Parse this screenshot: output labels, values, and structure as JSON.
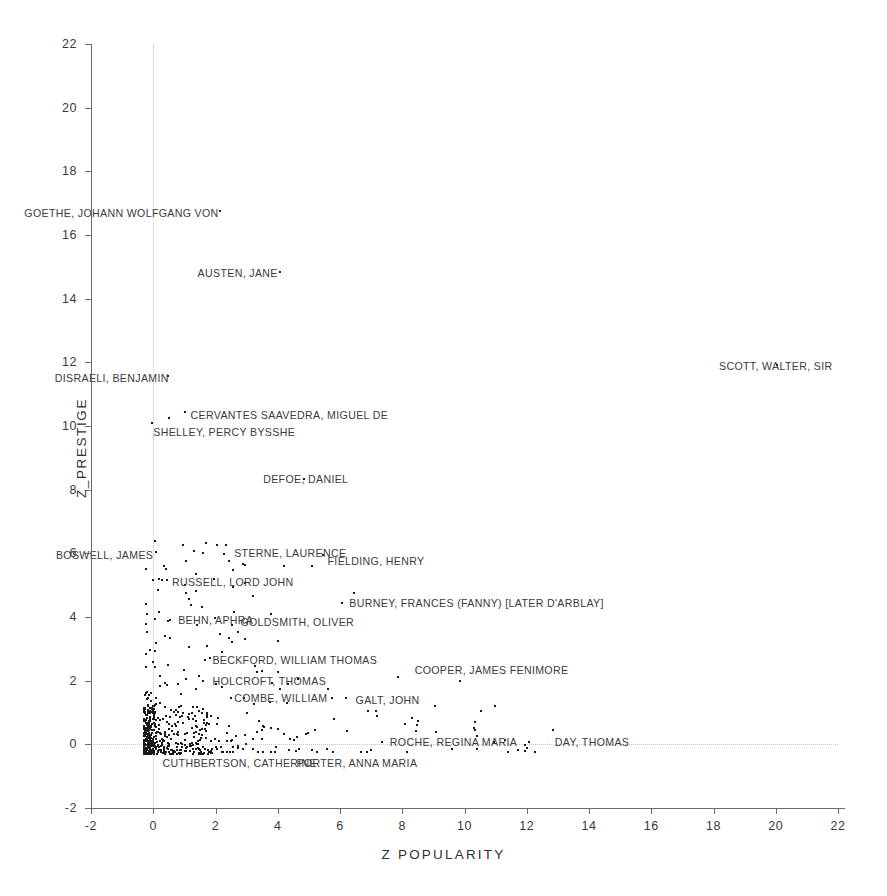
{
  "chart_data": {
    "type": "scatter",
    "title": "",
    "xlabel": "Z  POPULARITY",
    "ylabel": "Z_PRESTIGE",
    "xlim": [
      -2,
      22
    ],
    "ylim": [
      -2,
      22
    ],
    "xticks": [
      -2,
      0,
      2,
      4,
      6,
      8,
      10,
      12,
      14,
      16,
      18,
      20,
      22
    ],
    "yticks": [
      -2,
      0,
      2,
      4,
      6,
      8,
      10,
      12,
      14,
      16,
      18,
      20,
      22
    ],
    "grid": "dotted reference lines at x=0 and y=0 only",
    "legend": "none",
    "marker_color": "#1a1a1a",
    "axis_color": "#6a6a6a",
    "gridline_color": "#c8c6c2",
    "background": "#ffffff",
    "annotations": [
      {
        "label": "GOETHE, JOHANN WOLFGANG VON",
        "x": 2.1,
        "y": 16.7,
        "anchor": "right"
      },
      {
        "label": "AUSTEN, JANE",
        "x": 4.0,
        "y": 14.8,
        "anchor": "right"
      },
      {
        "label": "SCOTT, WALTER, SIR",
        "x": 20.0,
        "y": 11.9,
        "anchor": "center"
      },
      {
        "label": "DISRAELI, BENJAMIN",
        "x": 0.5,
        "y": 11.5,
        "anchor": "right"
      },
      {
        "label": "CERVANTES SAAVEDRA, MIGUEL DE",
        "x": 1.2,
        "y": 10.35,
        "anchor": "left"
      },
      {
        "label": "SHELLEY, PERCY BYSSHE",
        "x": 0.0,
        "y": 9.8,
        "anchor": "left"
      },
      {
        "label": "DEFOE, DANIEL",
        "x": 4.9,
        "y": 8.35,
        "anchor": "center"
      },
      {
        "label": "STERNE, LAURENCE",
        "x": 2.6,
        "y": 6.0,
        "anchor": "left"
      },
      {
        "label": "BOSWELL, JAMES",
        "x": 0.0,
        "y": 5.95,
        "anchor": "right"
      },
      {
        "label": "FIELDING, HENRY",
        "x": 5.6,
        "y": 5.75,
        "anchor": "left"
      },
      {
        "label": "RUSSELL, LORD JOHN",
        "x": 0.6,
        "y": 5.1,
        "anchor": "left"
      },
      {
        "label": "BURNEY, FRANCES (FANNY) [LATER D'ARBLAY]",
        "x": 6.3,
        "y": 4.45,
        "anchor": "left"
      },
      {
        "label": "BEHN, APHRA",
        "x": 0.8,
        "y": 3.9,
        "anchor": "left"
      },
      {
        "label": "GOLDSMITH, OLIVER",
        "x": 2.8,
        "y": 3.85,
        "anchor": "left"
      },
      {
        "label": "BECKFORD, WILLIAM THOMAS",
        "x": 1.9,
        "y": 2.65,
        "anchor": "left"
      },
      {
        "label": "COOPER, JAMES FENIMORE",
        "x": 8.4,
        "y": 2.35,
        "anchor": "left"
      },
      {
        "label": "HOLCROFT, THOMAS",
        "x": 1.9,
        "y": 2.0,
        "anchor": "left"
      },
      {
        "label": "COMBE, WILLIAM",
        "x": 2.6,
        "y": 1.45,
        "anchor": "left"
      },
      {
        "label": "GALT, JOHN",
        "x": 6.5,
        "y": 1.4,
        "anchor": "left"
      },
      {
        "label": "ROCHE, REGINA MARIA",
        "x": 7.6,
        "y": 0.08,
        "anchor": "left"
      },
      {
        "label": "DAY, THOMAS",
        "x": 12.9,
        "y": 0.08,
        "anchor": "left"
      },
      {
        "label": "CUTHBERTSON, CATHERINE",
        "x": 0.3,
        "y": -0.6,
        "anchor": "left"
      },
      {
        "label": "PORTER, ANNA MARIA",
        "x": 4.6,
        "y": -0.6,
        "anchor": "left"
      }
    ],
    "labeled_points": [
      {
        "name": "GOETHE, JOHANN WOLFGANG VON",
        "x": 2.14,
        "y": 16.75
      },
      {
        "name": "AUSTEN, JANE",
        "x": 4.07,
        "y": 14.85
      },
      {
        "name": "SCOTT, WALTER, SIR",
        "x": 20.03,
        "y": 11.93
      },
      {
        "name": "DISRAELI, BENJAMIN",
        "x": 0.48,
        "y": 11.58
      },
      {
        "name": "CERVANTES SAAVEDRA, MIGUEL DE",
        "x": 1.02,
        "y": 10.45
      },
      {
        "name": "CERVANTES-NEIGHBOUR",
        "x": 0.52,
        "y": 10.25
      },
      {
        "name": "SHELLEY, PERCY BYSSHE",
        "x": -0.05,
        "y": 10.1
      },
      {
        "name": "DEFOE, DANIEL",
        "x": 4.85,
        "y": 8.35
      },
      {
        "name": "STERNE, LAURENCE",
        "x": 2.35,
        "y": 6.25
      },
      {
        "name": "BOSWELL, JAMES",
        "x": 0.1,
        "y": 6.05
      },
      {
        "name": "FIELDING, HENRY",
        "x": 5.45,
        "y": 5.95
      },
      {
        "name": "RUSSELL, LORD JOHN",
        "x": 0.45,
        "y": 5.15
      },
      {
        "name": "BURNEY, FRANCES (FANNY) [LATER D'ARBLAY]",
        "x": 6.05,
        "y": 4.45
      },
      {
        "name": "BEHN, APHRA",
        "x": 0.55,
        "y": 3.9
      },
      {
        "name": "GOLDSMITH, OLIVER",
        "x": 2.6,
        "y": 4.15
      },
      {
        "name": "BECKFORD, WILLIAM THOMAS",
        "x": 1.65,
        "y": 2.65
      },
      {
        "name": "COOPER, JAMES FENIMORE",
        "x": 7.85,
        "y": 2.1
      },
      {
        "name": "COOPER-NEIGHBOUR",
        "x": 9.85,
        "y": 2.0
      },
      {
        "name": "HOLCROFT, THOMAS",
        "x": 1.6,
        "y": 2.0
      },
      {
        "name": "COMBE, WILLIAM",
        "x": 2.5,
        "y": 1.45
      },
      {
        "name": "GALT, JOHN",
        "x": 6.2,
        "y": 1.45
      },
      {
        "name": "ROCHE, REGINA MARIA",
        "x": 7.35,
        "y": 0.08
      },
      {
        "name": "DAY, THOMAS",
        "x": 12.85,
        "y": 0.45
      }
    ],
    "cluster_description": "Several hundred unlabeled points form a dense L-shaped mass hugging x in [-0.3, 2] and y in [-0.3, 1.5], thinning out to the right along y near 0 up to x about 13.",
    "n_points_approx": 520
  },
  "axis": {
    "x_title": "Z  POPULARITY",
    "y_title": "Z_PRESTIGE"
  }
}
